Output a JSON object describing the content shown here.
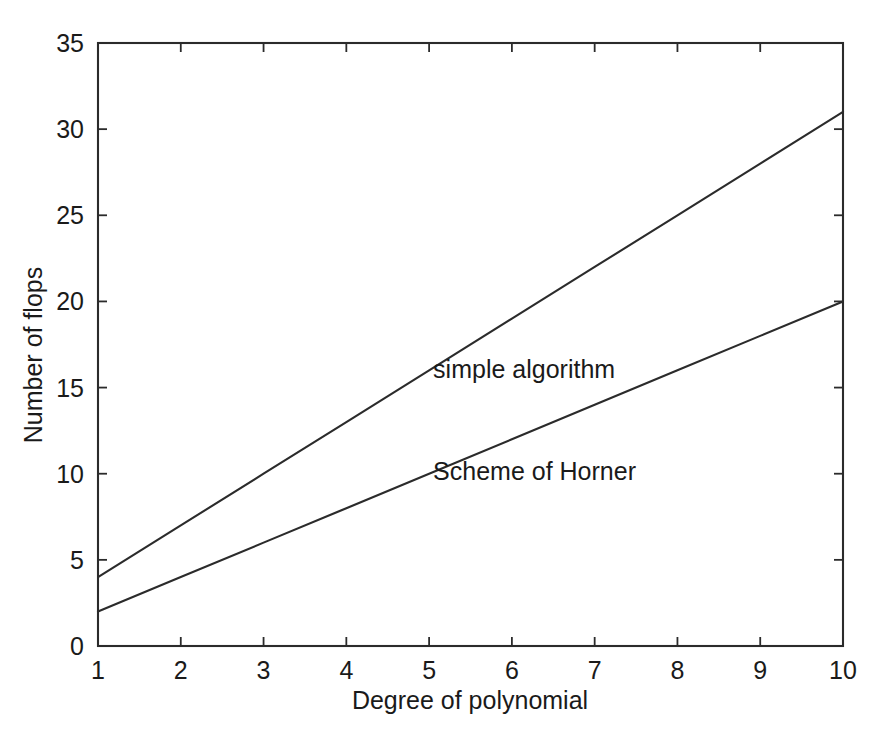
{
  "chart_data": {
    "type": "line",
    "title": "",
    "subtitle": "",
    "xlabel": "Degree of polynomial",
    "ylabel": "Number of flops",
    "xlim": [
      1,
      10
    ],
    "ylim": [
      0,
      35
    ],
    "xticks": [
      1,
      2,
      3,
      4,
      5,
      6,
      7,
      8,
      9,
      10
    ],
    "yticks": [
      0,
      5,
      10,
      15,
      20,
      25,
      30,
      35
    ],
    "xticklabels": [
      "1",
      "2",
      "3",
      "4",
      "5",
      "6",
      "7",
      "8",
      "9",
      "10"
    ],
    "yticklabels": [
      "0",
      "5",
      "10",
      "15",
      "20",
      "25",
      "30",
      "35"
    ],
    "grid": false,
    "legend": "none",
    "box": true,
    "tick_direction": "in",
    "line_color": "#2b2b2b",
    "background_color": "#ffffff",
    "x": [
      1,
      2,
      3,
      4,
      5,
      6,
      7,
      8,
      9,
      10
    ],
    "series": [
      {
        "name": "simple algorithm",
        "values": [
          4,
          7,
          10,
          13,
          16,
          19,
          22,
          25,
          28,
          31
        ],
        "annotation": {
          "text": "simple algorithm",
          "x": 5.0,
          "y": 16.0
        }
      },
      {
        "name": "Scheme of Horner",
        "values": [
          2,
          4,
          6,
          8,
          10,
          12,
          14,
          16,
          18,
          20
        ],
        "annotation": {
          "text": "Scheme of Horner",
          "x": 5.0,
          "y": 10.1
        }
      }
    ],
    "annotations": [
      {
        "text": "simple algorithm",
        "x": 5.0,
        "y": 16.0
      },
      {
        "text": "Scheme of Horner",
        "x": 5.0,
        "y": 10.1
      }
    ]
  }
}
